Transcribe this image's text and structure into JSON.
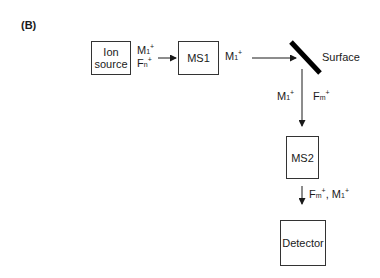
{
  "panel_label": "(B)",
  "nodes": {
    "ion_source": {
      "line1": "Ion",
      "line2": "source"
    },
    "ms1": {
      "label": "MS1"
    },
    "surface": {
      "label": "Surface"
    },
    "ms2": {
      "label": "MS2"
    },
    "detector": {
      "label": "Detector"
    }
  },
  "edge_labels": {
    "ion_source_out": {
      "top": {
        "base": "M",
        "sub": "1",
        "sup": "+"
      },
      "bottom": {
        "base": "F",
        "sub": "n",
        "sup": "+"
      }
    },
    "ms1_out": {
      "base": "M",
      "sub": "1",
      "sup": "+"
    },
    "surface_out_left": {
      "base": "M",
      "sub": "1",
      "sup": "+"
    },
    "surface_out_right": {
      "base": "F",
      "sub": "m",
      "sup": "+"
    },
    "ms2_out": {
      "a": {
        "base": "F",
        "sub": "m",
        "sup": "+"
      },
      "sep": ", ",
      "b": {
        "base": "M",
        "sub": "1",
        "sup": "+"
      }
    }
  },
  "colors": {
    "line": "#1a1a1a",
    "surface": "#000000",
    "background": "#ffffff"
  }
}
